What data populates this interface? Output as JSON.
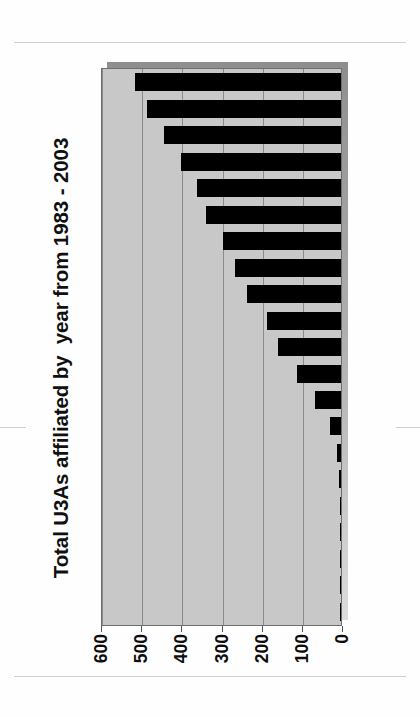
{
  "figure": {
    "title": "Total U3As affiliated by  year from 1983 - 2003",
    "orientation": "rotated-90-counterclockwise",
    "plot_background": "#c8c8c8",
    "bar_color": "#000000",
    "gridline_color": "#8a8a8a"
  },
  "axis": {
    "tick_labels": [
      "600",
      "500",
      "400",
      "300",
      "200",
      "100",
      "0"
    ],
    "tick_values": [
      600,
      500,
      400,
      300,
      200,
      100,
      0
    ],
    "min": 0,
    "max": 600
  },
  "chart_data": {
    "type": "bar",
    "title": "Total U3As affiliated by  year from 1983 - 2003",
    "xlabel": "",
    "ylabel": "",
    "orientation": "horizontal",
    "grid": true,
    "legend": "none",
    "ylim": [
      0,
      600
    ],
    "tick_labels": [
      "600",
      "500",
      "400",
      "300",
      "200",
      "100",
      "0"
    ],
    "categories": [
      "2003",
      "2002",
      "2001",
      "2000",
      "1999",
      "1998",
      "1997",
      "1996",
      "1995",
      "1994",
      "1993",
      "1992",
      "1991",
      "1990",
      "1989",
      "1988",
      "1987",
      "1986",
      "1985",
      "1984",
      "1983"
    ],
    "values": [
      513,
      482,
      440,
      399,
      358,
      336,
      294,
      264,
      235,
      185,
      156,
      110,
      65,
      28,
      11,
      4,
      0,
      0,
      0,
      0,
      0
    ],
    "bar_count": 21
  }
}
